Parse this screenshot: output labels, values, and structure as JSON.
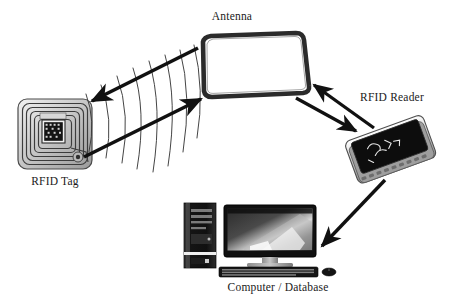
{
  "diagram": {
    "background_color": "#ffffff",
    "ink_color": "#111111",
    "nodes": [
      {
        "id": "rfid-tag",
        "label": "RFID Tag",
        "icon": "rfid-tag-icon",
        "description": "Smart card inlay with concentric square antenna coil and central microchip",
        "x": 55,
        "y": 135
      },
      {
        "id": "antenna",
        "label": "Antenna",
        "icon": "antenna-panel-icon",
        "description": "Rounded rectangular panel antenna outline",
        "x": 252,
        "y": 65
      },
      {
        "id": "rfid-reader",
        "label": "RFID Reader",
        "icon": "rfid-reader-icon",
        "description": "Tilted handheld reader slab with dark display and silver bezel",
        "x": 390,
        "y": 148
      },
      {
        "id": "computer-database",
        "label": "Computer / Database",
        "icon": "desktop-computer-icon",
        "description": "Desktop tower, widescreen monitor, keyboard and mouse",
        "x": 278,
        "y": 238
      }
    ],
    "connections": [
      {
        "id": "antenna-to-tag",
        "from": "antenna",
        "to": "rfid-tag",
        "style": "thick-arrow",
        "direction": "one-way"
      },
      {
        "id": "tag-to-antenna",
        "from": "rfid-tag",
        "to": "antenna",
        "style": "thick-arrow",
        "direction": "one-way"
      },
      {
        "id": "reader-to-antenna",
        "from": "rfid-reader",
        "to": "antenna",
        "style": "thick-arrow",
        "direction": "one-way"
      },
      {
        "id": "antenna-to-reader",
        "from": "antenna",
        "to": "rfid-reader",
        "style": "thick-arrow",
        "direction": "one-way"
      },
      {
        "id": "reader-to-computer",
        "from": "rfid-reader",
        "to": "computer-database",
        "style": "thick-arrow",
        "direction": "one-way"
      }
    ],
    "rf_waves": {
      "id": "rf-wave-arcs",
      "count": 8,
      "description": "Thin curved arcs crossing the tag-antenna link representing radio frequency waves"
    }
  },
  "labels": {
    "antenna": "Antenna",
    "rfid_tag": "RFID Tag",
    "rfid_reader": "RFID Reader",
    "computer_database": "Computer / Database"
  }
}
